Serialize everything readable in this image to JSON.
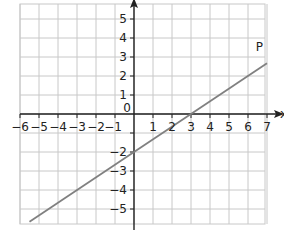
{
  "chart_data": {
    "type": "line",
    "title": "",
    "xlabel": "x",
    "ylabel": "y",
    "xlim": [
      -6,
      7
    ],
    "ylim": [
      -5.8,
      5.8
    ],
    "grid": true,
    "x_ticks": [
      -6,
      -5,
      -4,
      -3,
      -2,
      -1,
      0,
      1,
      2,
      3,
      4,
      5,
      6,
      7
    ],
    "x_tick_labels": [
      "−6",
      "−5",
      "−4",
      "−3",
      "−2",
      "−1",
      "0",
      "1",
      "2",
      "3",
      "4",
      "5",
      "6",
      "7"
    ],
    "y_ticks": [
      -5,
      -4,
      -3,
      -2,
      -1,
      1,
      2,
      3,
      4,
      5
    ],
    "y_tick_labels": [
      "−5",
      "−4",
      "−3",
      "−2",
      "−1",
      "1",
      "2",
      "3",
      "4",
      "5"
    ],
    "series": [
      {
        "name": "P",
        "equation": "y = (2/3)x − 2",
        "x": [
          -5.5,
          7
        ],
        "y": [
          -5.67,
          2.67
        ],
        "color": "#808080"
      }
    ],
    "annotations": [
      {
        "text": "P",
        "x": 6.6,
        "y": 3.3
      }
    ],
    "origin_label": "0"
  },
  "colors": {
    "grid": "#c8c8c8",
    "axis": "#222222",
    "line": "#808080"
  }
}
